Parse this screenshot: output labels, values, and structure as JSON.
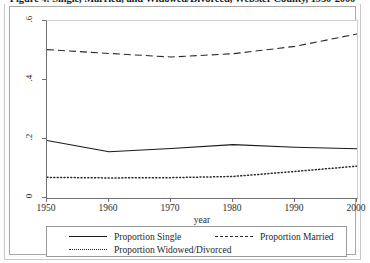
{
  "caption": {
    "text": "Figure 4: Single, Married, and Widowed/Divorced, Webster County, 1950-2000"
  },
  "chart_data": {
    "type": "line",
    "title": "",
    "xlabel": "year",
    "ylabel": "",
    "x": [
      1950,
      1960,
      1970,
      1980,
      1990,
      2000
    ],
    "xlim": [
      1950,
      2000
    ],
    "ylim": [
      0,
      0.6
    ],
    "xticks": [
      "1950",
      "1960",
      "1970",
      "1980",
      "1990",
      "2000"
    ],
    "yticks": [
      "0",
      ".2",
      ".4",
      ".6"
    ],
    "ytick_values": [
      0,
      0.2,
      0.4,
      0.6
    ],
    "grid": false,
    "legend_position": "bottom",
    "series": [
      {
        "name": "Proportion Single",
        "style": "solid",
        "color": "#1a1a1a",
        "values": [
          0.195,
          0.157,
          0.168,
          0.181,
          0.172,
          0.167
        ]
      },
      {
        "name": "Proportion Married",
        "style": "dashed",
        "color": "#2a2a2a",
        "values": [
          0.503,
          0.49,
          0.478,
          0.489,
          0.514,
          0.556
        ]
      },
      {
        "name": "Proportion Widowed/Divorced",
        "style": "dotted",
        "color": "#2a2a2a",
        "values": [
          0.07,
          0.068,
          0.069,
          0.073,
          0.09,
          0.108
        ]
      }
    ]
  },
  "legend": {
    "items": [
      {
        "label": "Proportion Single",
        "style": "solid"
      },
      {
        "label": "Proportion Married",
        "style": "dashed"
      },
      {
        "label": "Proportion Widowed/Divorced",
        "style": "dotted"
      }
    ]
  }
}
